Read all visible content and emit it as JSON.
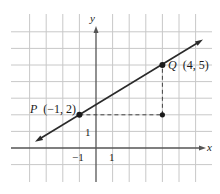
{
  "diagram": {
    "type": "coordinate-plane",
    "axes": {
      "x_label": "x",
      "y_label": "y",
      "x_tick_labels": [
        {
          "value": -1,
          "text": "−1"
        },
        {
          "value": 1,
          "text": "1"
        }
      ],
      "y_tick_labels": [
        {
          "value": 1,
          "text": "1"
        }
      ],
      "grid": {
        "x_min": -4,
        "x_max": 6,
        "y_min": -1,
        "y_max": 7
      }
    },
    "points": [
      {
        "name": "P",
        "x": -1,
        "y": 2,
        "label_name": "P",
        "label_coords": "(−1, 2)"
      },
      {
        "name": "Q",
        "x": 4,
        "y": 5,
        "label_name": "Q",
        "label_coords": "(4, 5)"
      },
      {
        "name": "corner",
        "x": 4,
        "y": 2
      }
    ],
    "line": {
      "through": [
        "P",
        "Q"
      ],
      "slope": "3/5",
      "arrows": "both"
    },
    "dashed_segments": [
      {
        "from": [
          -1,
          2
        ],
        "to": [
          4,
          2
        ]
      },
      {
        "from": [
          4,
          2
        ],
        "to": [
          4,
          5
        ]
      }
    ],
    "colors": {
      "grid": "#c8c8c8",
      "axis": "#555555",
      "line": "#2a2a2a",
      "dash": "#444444",
      "point": "#1a1a1a"
    }
  }
}
